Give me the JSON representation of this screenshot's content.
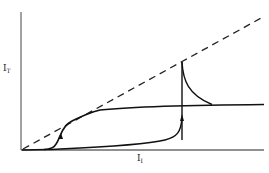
{
  "diagram": {
    "y_axis_label": {
      "main": "I",
      "sub": "T"
    },
    "x_axis_label": {
      "main": "I",
      "sub": "I"
    },
    "stroke_color": "#1a1a1a",
    "elements": [
      "dashed diagonal line I_T = I_I",
      "upper S-shaped curve saturating",
      "lower hysteresis branch with vertical jump (arrow up)",
      "relaxation decay curve after jump"
    ]
  }
}
